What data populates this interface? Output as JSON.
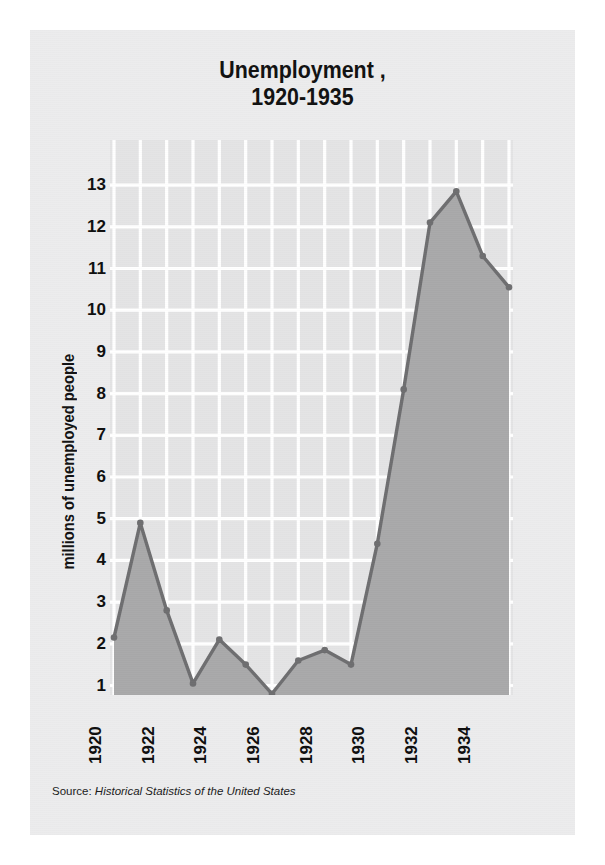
{
  "title": {
    "line1": "Unemployment ,",
    "line2": "1920-1935"
  },
  "source": {
    "prefix": "Source:",
    "citation": "Historical Statistics of the United States"
  },
  "colors": {
    "page_background": "#ececed",
    "plot_background": "#e4e4e5",
    "gridline": "#ffffff",
    "area_fill": "#a9a9aa",
    "line": "#6e6e70",
    "text": "#111111"
  },
  "chart_data": {
    "type": "area",
    "xlabel": "",
    "ylabel": "millions of unemployed people",
    "grid": true,
    "legend": "none",
    "xlim": [
      1920,
      1935
    ],
    "ylim": [
      0,
      13.5
    ],
    "x": [
      1920,
      1921,
      1922,
      1923,
      1924,
      1925,
      1926,
      1927,
      1928,
      1929,
      1930,
      1931,
      1932,
      1933,
      1934,
      1935
    ],
    "values": [
      2.15,
      4.9,
      2.8,
      1.05,
      2.1,
      1.5,
      0.8,
      1.6,
      1.85,
      1.5,
      4.4,
      8.1,
      12.1,
      12.85,
      11.3,
      10.55
    ],
    "y_ticks": [
      13,
      12,
      11,
      10,
      9,
      8,
      7,
      6,
      5,
      4,
      3,
      2,
      1
    ],
    "x_ticks": [
      1920,
      1922,
      1924,
      1926,
      1928,
      1930,
      1932,
      1934
    ],
    "x_tick_labels": [
      "1920",
      "1922",
      "1924",
      "1926",
      "1928",
      "1930",
      "1932",
      "1934"
    ],
    "y_tick_labels": [
      "13",
      "12",
      "11",
      "10",
      "9",
      "8",
      "7",
      "6",
      "5",
      "4",
      "3",
      "2",
      "1"
    ],
    "units": "millions of people"
  }
}
